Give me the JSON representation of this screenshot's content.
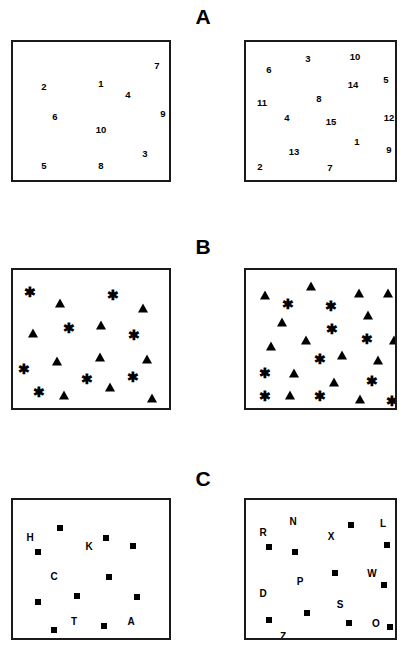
{
  "figure": {
    "background_color": "#ffffff",
    "ink_color": "#000000",
    "box_border_color": "#1a1a1a"
  },
  "panels": [
    {
      "id": "A",
      "label": "A",
      "label_x": 203,
      "label_y": 6,
      "item_type": "number",
      "boxes": [
        {
          "id": "A-left",
          "name": "panel-a-left-box",
          "x": 11,
          "y": 40,
          "w": 160,
          "h": 142,
          "item_count": 10,
          "items": [
            {
              "text": "7",
              "x": 144,
              "y": 24
            },
            {
              "text": "2",
              "x": 31,
              "y": 45
            },
            {
              "text": "1",
              "x": 88,
              "y": 42
            },
            {
              "text": "4",
              "x": 115,
              "y": 53
            },
            {
              "text": "6",
              "x": 42,
              "y": 75
            },
            {
              "text": "9",
              "x": 150,
              "y": 72
            },
            {
              "text": "10",
              "x": 88,
              "y": 88
            },
            {
              "text": "3",
              "x": 132,
              "y": 112
            },
            {
              "text": "5",
              "x": 31,
              "y": 124
            },
            {
              "text": "8",
              "x": 88,
              "y": 124
            }
          ]
        },
        {
          "id": "A-right",
          "name": "panel-a-right-box",
          "x": 244,
          "y": 40,
          "w": 153,
          "h": 142,
          "item_count": 15,
          "items": [
            {
              "text": "3",
              "x": 62,
              "y": 17
            },
            {
              "text": "10",
              "x": 109,
              "y": 15
            },
            {
              "text": "6",
              "x": 23,
              "y": 28
            },
            {
              "text": "5",
              "x": 140,
              "y": 38
            },
            {
              "text": "14",
              "x": 107,
              "y": 43
            },
            {
              "text": "8",
              "x": 73,
              "y": 57
            },
            {
              "text": "11",
              "x": 16,
              "y": 61
            },
            {
              "text": "4",
              "x": 41,
              "y": 76
            },
            {
              "text": "15",
              "x": 85,
              "y": 80
            },
            {
              "text": "12",
              "x": 143,
              "y": 76
            },
            {
              "text": "1",
              "x": 111,
              "y": 100
            },
            {
              "text": "13",
              "x": 48,
              "y": 110
            },
            {
              "text": "9",
              "x": 143,
              "y": 108
            },
            {
              "text": "2",
              "x": 14,
              "y": 125
            },
            {
              "text": "7",
              "x": 84,
              "y": 126
            }
          ]
        }
      ]
    },
    {
      "id": "B",
      "label": "B",
      "label_x": 203,
      "label_y": 236,
      "item_type": "shape",
      "shapes": {
        "star": "star-glyph",
        "triangle": "triangle-glyph"
      },
      "star_char": "✳",
      "boxes": [
        {
          "id": "B-left",
          "name": "panel-b-left-box",
          "x": 11,
          "y": 268,
          "w": 160,
          "h": 142,
          "item_count": 21,
          "items": [
            {
              "shape": "star",
              "x": 17,
              "y": 22
            },
            {
              "shape": "star",
              "x": 100,
              "y": 25
            },
            {
              "shape": "tri",
              "x": 47,
              "y": 33
            },
            {
              "shape": "tri",
              "x": 130,
              "y": 38
            },
            {
              "shape": "star",
              "x": 56,
              "y": 58
            },
            {
              "shape": "tri",
              "x": 88,
              "y": 55
            },
            {
              "shape": "tri",
              "x": 20,
              "y": 63
            },
            {
              "shape": "star",
              "x": 121,
              "y": 65
            },
            {
              "shape": "tri",
              "x": 87,
              "y": 87
            },
            {
              "shape": "tri",
              "x": 44,
              "y": 91
            },
            {
              "shape": "tri",
              "x": 134,
              "y": 89
            },
            {
              "shape": "star",
              "x": 11,
              "y": 99
            },
            {
              "shape": "star",
              "x": 74,
              "y": 109
            },
            {
              "shape": "star",
              "x": 120,
              "y": 107
            },
            {
              "shape": "tri",
              "x": 97,
              "y": 117
            },
            {
              "shape": "star",
              "x": 26,
              "y": 122
            },
            {
              "shape": "tri",
              "x": 51,
              "y": 125
            },
            {
              "shape": "tri",
              "x": 139,
              "y": 128
            }
          ]
        },
        {
          "id": "B-right",
          "name": "panel-b-right-box",
          "x": 244,
          "y": 268,
          "w": 153,
          "h": 142,
          "item_count": 26,
          "items": [
            {
              "shape": "tri",
              "x": 65,
              "y": 16
            },
            {
              "shape": "tri",
              "x": 19,
              "y": 25
            },
            {
              "shape": "tri",
              "x": 113,
              "y": 23
            },
            {
              "shape": "tri",
              "x": 142,
              "y": 23
            },
            {
              "shape": "star",
              "x": 42,
              "y": 34
            },
            {
              "shape": "star",
              "x": 85,
              "y": 36
            },
            {
              "shape": "tri",
              "x": 122,
              "y": 45
            },
            {
              "shape": "tri",
              "x": 36,
              "y": 52
            },
            {
              "shape": "star",
              "x": 86,
              "y": 59
            },
            {
              "shape": "star",
              "x": 121,
              "y": 69
            },
            {
              "shape": "tri",
              "x": 60,
              "y": 70
            },
            {
              "shape": "tri",
              "x": 25,
              "y": 76
            },
            {
              "shape": "tri",
              "x": 148,
              "y": 70
            },
            {
              "shape": "tri",
              "x": 96,
              "y": 85
            },
            {
              "shape": "star",
              "x": 74,
              "y": 89
            },
            {
              "shape": "tri",
              "x": 132,
              "y": 90
            },
            {
              "shape": "star",
              "x": 19,
              "y": 103
            },
            {
              "shape": "tri",
              "x": 48,
              "y": 103
            },
            {
              "shape": "tri",
              "x": 88,
              "y": 112
            },
            {
              "shape": "star",
              "x": 126,
              "y": 111
            },
            {
              "shape": "star",
              "x": 19,
              "y": 126
            },
            {
              "shape": "tri",
              "x": 44,
              "y": 125
            },
            {
              "shape": "star",
              "x": 74,
              "y": 126
            },
            {
              "shape": "tri",
              "x": 114,
              "y": 129
            },
            {
              "shape": "star",
              "x": 146,
              "y": 131
            }
          ]
        }
      ]
    },
    {
      "id": "C",
      "label": "C",
      "label_x": 203,
      "label_y": 468,
      "item_type": "letter-and-square",
      "boxes": [
        {
          "id": "C-left",
          "name": "panel-c-left-box",
          "x": 11,
          "y": 498,
          "w": 160,
          "h": 142,
          "letter_count": 5,
          "square_count": 9,
          "letters": [
            {
              "text": "H",
              "x": 17,
              "y": 38
            },
            {
              "text": "K",
              "x": 76,
              "y": 47
            },
            {
              "text": "C",
              "x": 41,
              "y": 77
            },
            {
              "text": "T",
              "x": 61,
              "y": 122
            },
            {
              "text": "A",
              "x": 118,
              "y": 122
            }
          ],
          "squares": [
            {
              "x": 47,
              "y": 28
            },
            {
              "x": 93,
              "y": 38
            },
            {
              "x": 120,
              "y": 46
            },
            {
              "x": 25,
              "y": 52
            },
            {
              "x": 96,
              "y": 77
            },
            {
              "x": 64,
              "y": 96
            },
            {
              "x": 124,
              "y": 97
            },
            {
              "x": 25,
              "y": 102
            },
            {
              "x": 41,
              "y": 130
            },
            {
              "x": 91,
              "y": 126
            }
          ]
        },
        {
          "id": "C-right",
          "name": "panel-c-right-box",
          "x": 244,
          "y": 498,
          "w": 153,
          "h": 142,
          "letter_count": 9,
          "square_count": 9,
          "letters": [
            {
              "text": "N",
              "x": 47,
              "y": 22
            },
            {
              "text": "L",
              "x": 137,
              "y": 24
            },
            {
              "text": "R",
              "x": 17,
              "y": 33
            },
            {
              "text": "X",
              "x": 85,
              "y": 37
            },
            {
              "text": "W",
              "x": 126,
              "y": 74
            },
            {
              "text": "P",
              "x": 54,
              "y": 82
            },
            {
              "text": "D",
              "x": 17,
              "y": 94
            },
            {
              "text": "S",
              "x": 94,
              "y": 105
            },
            {
              "text": "O",
              "x": 130,
              "y": 124
            },
            {
              "text": "Z",
              "x": 37,
              "y": 137
            }
          ],
          "squares": [
            {
              "x": 105,
              "y": 25
            },
            {
              "x": 141,
              "y": 45
            },
            {
              "x": 23,
              "y": 47
            },
            {
              "x": 49,
              "y": 52
            },
            {
              "x": 89,
              "y": 73
            },
            {
              "x": 138,
              "y": 85
            },
            {
              "x": 61,
              "y": 113
            },
            {
              "x": 23,
              "y": 120
            },
            {
              "x": 103,
              "y": 123
            },
            {
              "x": 144,
              "y": 127
            }
          ]
        }
      ]
    }
  ],
  "chart_data": {
    "type": "scatter",
    "panels": [
      {
        "panel": "A",
        "element_type": "digits",
        "left_array": [
          "1",
          "2",
          "3",
          "4",
          "5",
          "6",
          "7",
          "8",
          "9",
          "10"
        ],
        "right_array": [
          "1",
          "2",
          "3",
          "4",
          "5",
          "6",
          "7",
          "8",
          "9",
          "10",
          "11",
          "12",
          "13",
          "14",
          "15"
        ],
        "left_count": 10,
        "right_count": 15
      },
      {
        "panel": "B",
        "element_type": "symbols",
        "symbols": [
          "star",
          "triangle"
        ],
        "left_count": 18,
        "right_count": 25,
        "left_star_count": 7,
        "left_triangle_count": 11,
        "right_star_count": 9,
        "right_triangle_count": 16
      },
      {
        "panel": "C",
        "element_type": "letters-and-squares",
        "left_letters": [
          "H",
          "K",
          "C",
          "T",
          "A"
        ],
        "right_letters": [
          "N",
          "L",
          "R",
          "X",
          "W",
          "P",
          "D",
          "S",
          "O",
          "Z"
        ],
        "left_square_count": 10,
        "right_square_count": 10
      }
    ]
  }
}
